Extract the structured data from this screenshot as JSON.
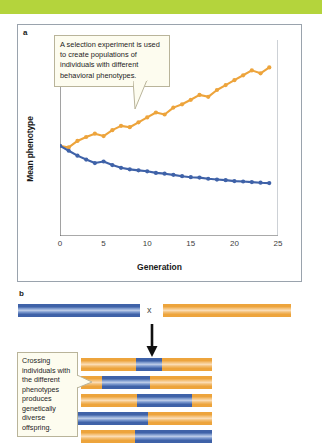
{
  "figure": {
    "panel_a_label": "a",
    "panel_b_label": "b"
  },
  "colors": {
    "banner_green": "#b4d43c",
    "series_high": "#eda43c",
    "series_low": "#3f62a8",
    "callout_bg": "#fdfcef",
    "callout_border": "#b9b49a",
    "frame": "#9aa3ad"
  },
  "callouts": {
    "a": "A selection experiment is used to create populations of individuals with different behavioral phenotypes.",
    "b": "Crossing individuals with the different phenotypes produces genetically diverse offspring."
  },
  "panel_b": {
    "cross_symbol": "x",
    "arrow": "down-arrow",
    "parents": [
      {
        "name": "parent-blue",
        "segments": [
          {
            "color": "blue",
            "frac": 1.0
          }
        ]
      },
      {
        "name": "parent-orange",
        "segments": [
          {
            "color": "orange",
            "frac": 1.0
          }
        ]
      }
    ],
    "offspring": [
      {
        "name": "offspring-1",
        "segments": [
          {
            "color": "orange",
            "frac": 0.42
          },
          {
            "color": "blue",
            "frac": 0.2
          },
          {
            "color": "orange",
            "frac": 0.38
          }
        ]
      },
      {
        "name": "offspring-2",
        "segments": [
          {
            "color": "orange",
            "frac": 0.16
          },
          {
            "color": "blue",
            "frac": 0.37
          },
          {
            "color": "orange",
            "frac": 0.47
          }
        ]
      },
      {
        "name": "offspring-3",
        "segments": [
          {
            "color": "orange",
            "frac": 0.43
          },
          {
            "color": "blue",
            "frac": 0.42
          },
          {
            "color": "orange",
            "frac": 0.15
          }
        ]
      },
      {
        "name": "offspring-4",
        "segments": [
          {
            "color": "blue",
            "frac": 0.53
          },
          {
            "color": "orange",
            "frac": 0.47
          }
        ]
      },
      {
        "name": "offspring-5",
        "segments": [
          {
            "color": "orange",
            "frac": 0.41
          },
          {
            "color": "blue",
            "frac": 0.59
          }
        ]
      }
    ]
  },
  "chart_data": {
    "type": "line",
    "title": "",
    "xlabel": "Generation",
    "ylabel": "Mean phenotype",
    "xlim": [
      0,
      25
    ],
    "ylim": [
      0,
      10
    ],
    "xticks": [
      0,
      5,
      10,
      15,
      20,
      25
    ],
    "yticks": [],
    "grid": false,
    "legend": "none",
    "x": [
      0,
      1,
      2,
      3,
      4,
      5,
      6,
      7,
      8,
      9,
      10,
      11,
      12,
      13,
      14,
      15,
      16,
      17,
      18,
      19,
      20,
      21,
      22,
      23,
      24
    ],
    "series": [
      {
        "name": "High-selected line",
        "color": "#eda43c",
        "marker": "circle",
        "values": [
          4.6,
          4.52,
          4.85,
          5.05,
          5.22,
          5.1,
          5.4,
          5.62,
          5.55,
          5.8,
          6.05,
          6.3,
          6.2,
          6.55,
          6.72,
          6.95,
          7.2,
          7.1,
          7.45,
          7.7,
          7.95,
          8.2,
          8.45,
          8.3,
          8.6
        ]
      },
      {
        "name": "Low-selected line",
        "color": "#3f62a8",
        "marker": "circle",
        "values": [
          4.6,
          4.35,
          4.1,
          3.9,
          3.72,
          3.8,
          3.62,
          3.48,
          3.4,
          3.35,
          3.3,
          3.22,
          3.18,
          3.12,
          3.05,
          3.0,
          2.98,
          2.92,
          2.88,
          2.85,
          2.8,
          2.78,
          2.75,
          2.72,
          2.7
        ]
      }
    ]
  }
}
